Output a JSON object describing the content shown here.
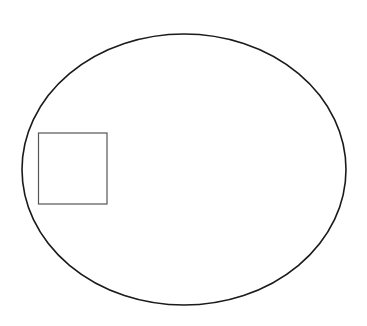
{
  "diagram": {
    "background": "#ffffff",
    "ellipse": {
      "cx": 184,
      "cy": 169.5,
      "rx": 162,
      "ry": 135.5,
      "stroke": "#1a1a1a",
      "stroke_width": 1.6
    },
    "square": {
      "x": 38.5,
      "y": 133,
      "width": 68.5,
      "height": 71,
      "stroke": "#555555",
      "stroke_width": 1.2
    }
  }
}
